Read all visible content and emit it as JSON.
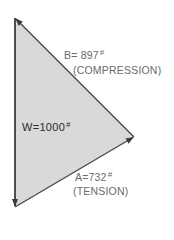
{
  "diagram": {
    "type": "force-triangle",
    "colors": {
      "fill": "#d9d9d9",
      "edge": "#3a3a3a",
      "outer_text": "#6a6a6a",
      "inner_text": "#2a2a2a"
    },
    "vertices": {
      "top": [
        15,
        18
      ],
      "bottom": [
        15,
        207
      ],
      "right": [
        134,
        137
      ]
    },
    "forces": {
      "W": {
        "label": "W=1000",
        "unit_mark": "#"
      },
      "B": {
        "label": "B= 897",
        "unit_mark": "#",
        "type": "(COMPRESSION)"
      },
      "A": {
        "label": "A=732",
        "unit_mark": "#",
        "type": "(TENSION)"
      }
    }
  }
}
